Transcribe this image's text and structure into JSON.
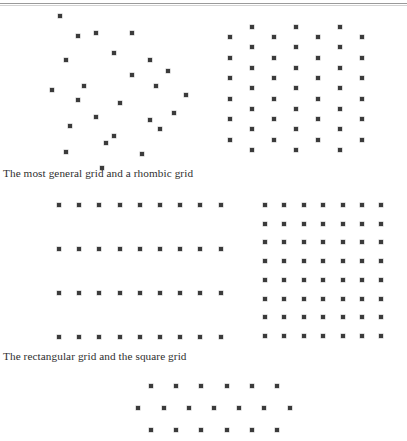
{
  "page": {
    "width": 407,
    "height": 441,
    "background": "#ffffff",
    "dot_color": "#3b3b3b",
    "rule_color": "#9a9a9a",
    "text_color": "#2e2e2e"
  },
  "captions": [
    {
      "id": "caption-1",
      "text": "The most general grid and a rhombic grid"
    },
    {
      "id": "caption-2",
      "text": "The rectangular grid and the square grid"
    }
  ],
  "figures": [
    {
      "name": "oblique-lattice",
      "label": "The most general grid",
      "lattice_type": "oblique",
      "origin": [
        60,
        16
      ],
      "vector_a": [
        36,
        17
      ],
      "vector_b": [
        -14,
        31
      ],
      "cols": 5,
      "rows": 5,
      "dots": [
        [
          60,
          16
        ],
        [
          96,
          33
        ],
        [
          132,
          33
        ],
        [
          150,
          60
        ],
        [
          132,
          75
        ],
        [
          114,
          53
        ],
        [
          78,
          36
        ],
        [
          66,
          60
        ],
        [
          84,
          86
        ],
        [
          120,
          103
        ],
        [
          156,
          86
        ],
        [
          150,
          120
        ],
        [
          114,
          136
        ],
        [
          96,
          117
        ],
        [
          78,
          100
        ],
        [
          52,
          90
        ],
        [
          70,
          126
        ],
        [
          106,
          143
        ],
        [
          142,
          154
        ],
        [
          160,
          129
        ],
        [
          66,
          152
        ],
        [
          102,
          168
        ],
        [
          174,
          113
        ],
        [
          186,
          95
        ],
        [
          168,
          71
        ]
      ]
    },
    {
      "name": "rhombic-lattice",
      "label": "a rhombic grid",
      "lattice_type": "centered-rectangular",
      "col_start_x": 230,
      "col_spacing": 22,
      "row_start_y": 37,
      "row_spacing": 20.5,
      "row_offset_y": -10.2,
      "cols": 7,
      "rows_main": 6,
      "rows_offset": 7
    },
    {
      "name": "rectangular-lattice",
      "label": "The rectangular grid",
      "lattice_type": "rectangular",
      "col_start_x": 59,
      "col_spacing": 20.2,
      "row_start_y": 205,
      "row_spacing": 44,
      "cols": 9,
      "rows": 4
    },
    {
      "name": "square-lattice",
      "label": "the square grid",
      "lattice_type": "square",
      "col_start_x": 265,
      "col_spacing": 19.4,
      "row_start_y": 205,
      "row_spacing": 18.7,
      "cols": 7,
      "rows": 8
    },
    {
      "name": "hexagonal-lattice",
      "label": "hexagonal grid",
      "lattice_type": "hexagonal",
      "col_start_x": 151,
      "col_spacing": 25.2,
      "row_start_y": 386,
      "row_spacing": 22,
      "rows": [
        {
          "offset_x": 0,
          "count": 6
        },
        {
          "offset_x": -12.6,
          "count": 7
        },
        {
          "offset_x": 0,
          "count": 6
        }
      ]
    }
  ]
}
